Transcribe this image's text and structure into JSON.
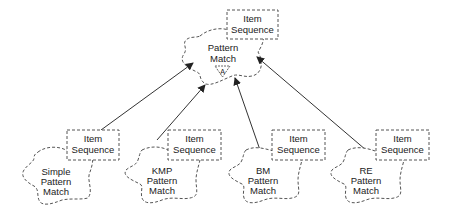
{
  "diagram": {
    "notation": "class-category diagram",
    "root": {
      "name_lines": [
        "Pattern",
        "Match"
      ],
      "adornment": "A",
      "parameter_lines": [
        "Item",
        "Sequence"
      ]
    },
    "children": [
      {
        "name_lines": [
          "Simple",
          "Pattern",
          "Match"
        ],
        "parameter_lines": [
          "Item",
          "Sequence"
        ]
      },
      {
        "name_lines": [
          "KMP",
          "Pattern",
          "Match"
        ],
        "parameter_lines": [
          "Item",
          "Sequence"
        ]
      },
      {
        "name_lines": [
          "BM",
          "Pattern",
          "Match"
        ],
        "parameter_lines": [
          "Item",
          "Sequence"
        ]
      },
      {
        "name_lines": [
          "RE",
          "Pattern",
          "Match"
        ],
        "parameter_lines": [
          "Item",
          "Sequence"
        ]
      }
    ],
    "relationships": [
      {
        "from": "Simple Pattern Match",
        "to": "Pattern Match",
        "type": "inherits"
      },
      {
        "from": "KMP Pattern Match",
        "to": "Pattern Match",
        "type": "inherits"
      },
      {
        "from": "BM Pattern Match",
        "to": "Pattern Match",
        "type": "inherits"
      },
      {
        "from": "RE Pattern Match",
        "to": "Pattern Match",
        "type": "inherits"
      }
    ]
  }
}
